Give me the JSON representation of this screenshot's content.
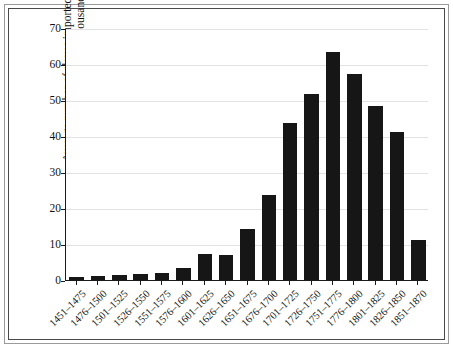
{
  "chart_data": {
    "type": "bar",
    "title": "",
    "subtitle": "",
    "xlabel": "",
    "ylabel": "Average number of slaves imported annually to the Americas in thousands",
    "ylim": [
      0,
      70
    ],
    "yticks": [
      0,
      10,
      20,
      30,
      40,
      50,
      60,
      70
    ],
    "grid": true,
    "legend": null,
    "bar_color": "#161616",
    "categories": [
      "1451–1475",
      "1476–1500",
      "1501–1525",
      "1526–1550",
      "1551–1575",
      "1576–1600",
      "1601–1625",
      "1626–1650",
      "1651–1675",
      "1676–1700",
      "1701–1725",
      "1726–1750",
      "1751–1775",
      "1776–1800",
      "1801–1825",
      "1826–1850",
      "1851–1870"
    ],
    "values": [
      0.8,
      1.0,
      1.3,
      1.7,
      2.0,
      3.4,
      7.2,
      6.9,
      14.2,
      23.5,
      43.5,
      51.7,
      63.2,
      57.2,
      48.2,
      41.0,
      11.0
    ]
  }
}
